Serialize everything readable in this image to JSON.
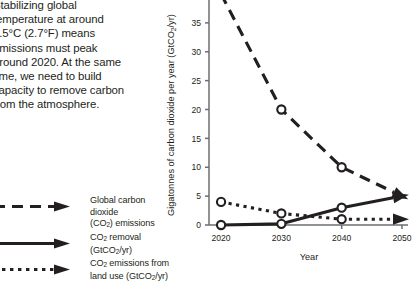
{
  "blurb": {
    "line1": "Stabilizing global",
    "line2": "temperature at around",
    "line3": "1.5°C (2.7°F) means",
    "line4": "emissions must peak",
    "line5": "around 2020. At the same",
    "line6": "time, we need to build",
    "line7": "capacity to remove carbon",
    "line8": "from the atmosphere."
  },
  "legend": {
    "items": [
      {
        "id": "global-co2-emissions",
        "style": "dashed",
        "line1_a": "Global carbon dioxide",
        "line2_a": "(CO",
        "line2_sub": "2",
        "line2_b": ") emissions"
      },
      {
        "id": "co2-removal",
        "style": "solid",
        "line1_a": "CO",
        "line1_sub": "2",
        "line1_b": " removal (GtCO",
        "line1_sub2": "2",
        "line1_c": "/yr)"
      },
      {
        "id": "co2-emissions-land-use",
        "style": "dotted",
        "line1_a": "CO",
        "line1_sub": "2",
        "line1_b": " emissions from",
        "line2_a": "land use (GtCO",
        "line2_sub": "2",
        "line2_b": "/yr)"
      }
    ]
  },
  "chart_data": {
    "type": "line",
    "title": "",
    "xlabel": "Year",
    "ylabel_parts": {
      "a": "Gigatonnes of carbon dioxide per year (GtCO",
      "sub": "2",
      "b": "/yr)"
    },
    "ylabel": "Gigatonnes of carbon dioxide per year (GtCO2/yr)",
    "x": [
      2020,
      2030,
      2040,
      2050
    ],
    "xtick_labels": [
      "2020",
      "2030",
      "2040",
      "2050"
    ],
    "xlim": [
      2018,
      2051
    ],
    "ylim": [
      0,
      40
    ],
    "yticks": [
      0,
      5,
      10,
      15,
      20,
      25,
      30,
      35
    ],
    "ytick_labels": [
      "0",
      "5",
      "10",
      "15",
      "20",
      "25",
      "30",
      "35"
    ],
    "grid": false,
    "legend_position": "outside-left",
    "axis_color": "#6d6e71",
    "line_color": "#231f20",
    "series": [
      {
        "name": "Global carbon dioxide (CO2) emissions",
        "style": "dashed",
        "arrow": true,
        "markers": true,
        "values": [
          40,
          20,
          10,
          5
        ]
      },
      {
        "name": "CO2 removal (GtCO2/yr)",
        "style": "solid",
        "arrow": true,
        "markers": true,
        "values": [
          0,
          0.2,
          3,
          5
        ]
      },
      {
        "name": "CO2 emissions from land use (GtCO2/yr)",
        "style": "dotted",
        "arrow": true,
        "markers": true,
        "values": [
          4,
          2,
          1,
          1
        ]
      }
    ]
  }
}
